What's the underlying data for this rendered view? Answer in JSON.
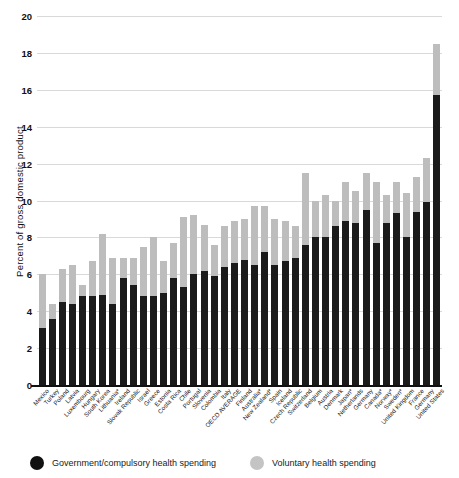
{
  "chart_data": {
    "type": "bar",
    "title": "",
    "subtitle": "",
    "xlabel": "",
    "ylabel": "Percent of gross domestic product",
    "ylim": [
      0,
      20
    ],
    "yticks": [
      0,
      2,
      4,
      6,
      8,
      10,
      12,
      14,
      16,
      18,
      20
    ],
    "grid": true,
    "stacked": true,
    "legend_position": "bottom",
    "categories": [
      "Mexico",
      "Turkey",
      "Poland",
      "Latvia",
      "Luxembourg",
      "Hungary",
      "South Korea",
      "Lithuania*",
      "Ireland",
      "Slovak Republic",
      "Israel",
      "Greece",
      "Estonia",
      "Costa Rica",
      "Chile",
      "Portugal",
      "Slovenia",
      "Colombia",
      "Italy",
      "OECD AVERAGE",
      "Finland",
      "Australia*",
      "New Zealand*",
      "Spain",
      "Iceland",
      "Czech Republic",
      "Switzerland",
      "Belgium",
      "Austria",
      "Denmark",
      "Japan*",
      "Netherlands",
      "Germany",
      "Canada*",
      "Norway*",
      "Sweden*",
      "United Kingdom",
      "France",
      "Germany",
      "United States"
    ],
    "series": [
      {
        "name": "Government/compulsory health spending",
        "color": "#1a1a1a",
        "values": [
          3.1,
          3.6,
          4.5,
          4.4,
          4.8,
          4.8,
          4.9,
          4.4,
          5.8,
          5.4,
          4.8,
          4.8,
          5.0,
          5.8,
          5.3,
          6.0,
          6.2,
          5.9,
          6.4,
          6.6,
          6.8,
          6.5,
          7.2,
          6.5,
          6.7,
          6.9,
          7.6,
          8.0,
          8.0,
          8.6,
          8.9,
          8.8,
          9.5,
          7.7,
          8.8,
          9.3,
          8.0,
          9.4,
          9.9,
          15.7
        ]
      },
      {
        "name": "Voluntary health spending",
        "color": "#bdbdbd",
        "values": [
          2.9,
          0.8,
          1.8,
          2.1,
          0.6,
          1.9,
          3.3,
          2.5,
          1.1,
          1.5,
          2.7,
          3.2,
          1.7,
          1.9,
          3.8,
          3.2,
          2.5,
          1.7,
          2.2,
          2.3,
          2.2,
          3.2,
          2.5,
          2.5,
          2.2,
          1.7,
          3.9,
          2.0,
          2.3,
          1.4,
          2.1,
          1.7,
          2.0,
          3.3,
          1.5,
          1.7,
          2.4,
          1.9,
          2.4,
          2.8
        ]
      }
    ],
    "legend": [
      {
        "label": "Government/compulsory health spending",
        "color": "#1a1a1a",
        "marker": "circle"
      },
      {
        "label": "Voluntary health spending",
        "color": "#c4c4c4",
        "marker": "circle"
      }
    ]
  }
}
